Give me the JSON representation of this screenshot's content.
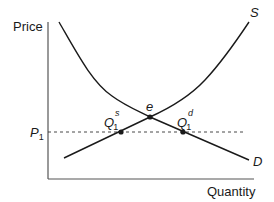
{
  "diagram": {
    "title": "",
    "y_axis_label": "Price",
    "x_axis_label": "Quantity",
    "price_level": {
      "label": "P",
      "subscript": "1"
    },
    "curves": {
      "supply": {
        "label": "S"
      },
      "demand": {
        "label": "D"
      }
    },
    "points": {
      "equilibrium": {
        "label": "e"
      },
      "quantity_supplied": {
        "label": "Q",
        "subscript": "1",
        "superscript": "s"
      },
      "quantity_demanded": {
        "label": "Q",
        "subscript": "1",
        "superscript": "d"
      }
    },
    "colors": {
      "line": "#1a1a1a",
      "dashed": "#333333",
      "axis": "#555555"
    }
  }
}
